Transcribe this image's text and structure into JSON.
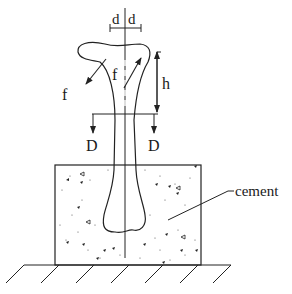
{
  "figure": {
    "labels": {
      "d_left": "d",
      "d_right": "d",
      "f_outer": "f",
      "f_inner": "f",
      "h": "h",
      "D_left": "D",
      "D_right": "D",
      "cement": "cement"
    },
    "colors": {
      "line": "#222222",
      "background": "#ffffff"
    }
  }
}
